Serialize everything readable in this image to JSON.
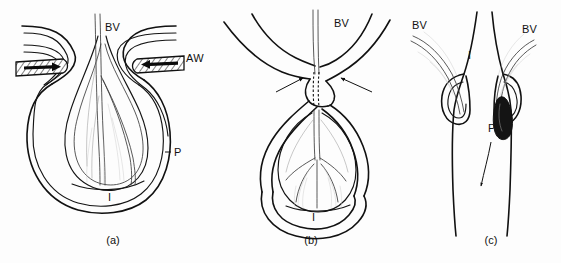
{
  "figure": {
    "background_color": "#fdfdfd",
    "ink_color": "#111111",
    "vessel_color": "#3b3b3b",
    "width": 561,
    "height": 263
  },
  "panels": [
    {
      "id": "a",
      "caption": "(a)",
      "caption_x": 113,
      "caption_y": 244,
      "description": "Patent airway unit: open interstitial space with blood vessel descending into a distended lobule; airways enter from both sides; pleura forms the outer envelope."
    },
    {
      "id": "b",
      "caption": "(b)",
      "caption_x": 311,
      "caption_y": 244,
      "description": "Constricted neck: opposing arrows indicate compressive forces narrowing the stalk; dashed lines mark the compressed channel; the lobule below shows a branching vascular tree."
    },
    {
      "id": "c",
      "caption": "(c)",
      "caption_x": 491,
      "caption_y": 244,
      "description": "Cross-channel view: two blood vessels enter from either side toward a dark obstructing plug; the arrow shows downstream flow direction."
    }
  ],
  "labels": [
    {
      "key": "a_bv",
      "text": "BV",
      "x": 105,
      "y": 31,
      "panel": "a",
      "meaning": "blood-vessel"
    },
    {
      "key": "a_aw",
      "text": "AW",
      "x": 186,
      "y": 62,
      "panel": "a",
      "meaning": "airway"
    },
    {
      "key": "a_p",
      "text": "P",
      "x": 174,
      "y": 156,
      "panel": "a",
      "meaning": "pleura"
    },
    {
      "key": "a_i",
      "text": "I",
      "x": 108,
      "y": 201,
      "panel": "a",
      "meaning": "interstitium"
    },
    {
      "key": "b_bv",
      "text": "BV",
      "x": 334,
      "y": 27,
      "panel": "b",
      "meaning": "blood-vessel"
    },
    {
      "key": "b_i",
      "text": "I",
      "x": 312,
      "y": 221,
      "panel": "b",
      "meaning": "interstitium"
    },
    {
      "key": "c_bv_left",
      "text": "BV",
      "x": 412,
      "y": 29,
      "panel": "c",
      "meaning": "blood-vessel"
    },
    {
      "key": "c_bv_right",
      "text": "BV",
      "x": 522,
      "y": 33,
      "panel": "c",
      "meaning": "blood-vessel"
    },
    {
      "key": "c_i",
      "text": "I",
      "x": 468,
      "y": 59,
      "panel": "c",
      "meaning": "interstitium"
    },
    {
      "key": "c_p",
      "text": "P",
      "x": 488,
      "y": 132,
      "panel": "c",
      "meaning": "plug-pleura"
    }
  ],
  "markers": {
    "panel_a_airway_left_arrow": "arrow pointing right into the left hatched airway",
    "panel_a_airway_right_arrow": "arrow pointing left into the right hatched airway",
    "panel_b_left_arrow": "arrow pointing up-right at the constricted neck",
    "panel_b_right_arrow": "arrow pointing up-left at the constricted neck",
    "panel_b_dashed_channel": "dashed vertical pair marking the compressed lumen",
    "panel_c_flow_arrow": "slender arrow pointing downstream below the dark plug"
  }
}
